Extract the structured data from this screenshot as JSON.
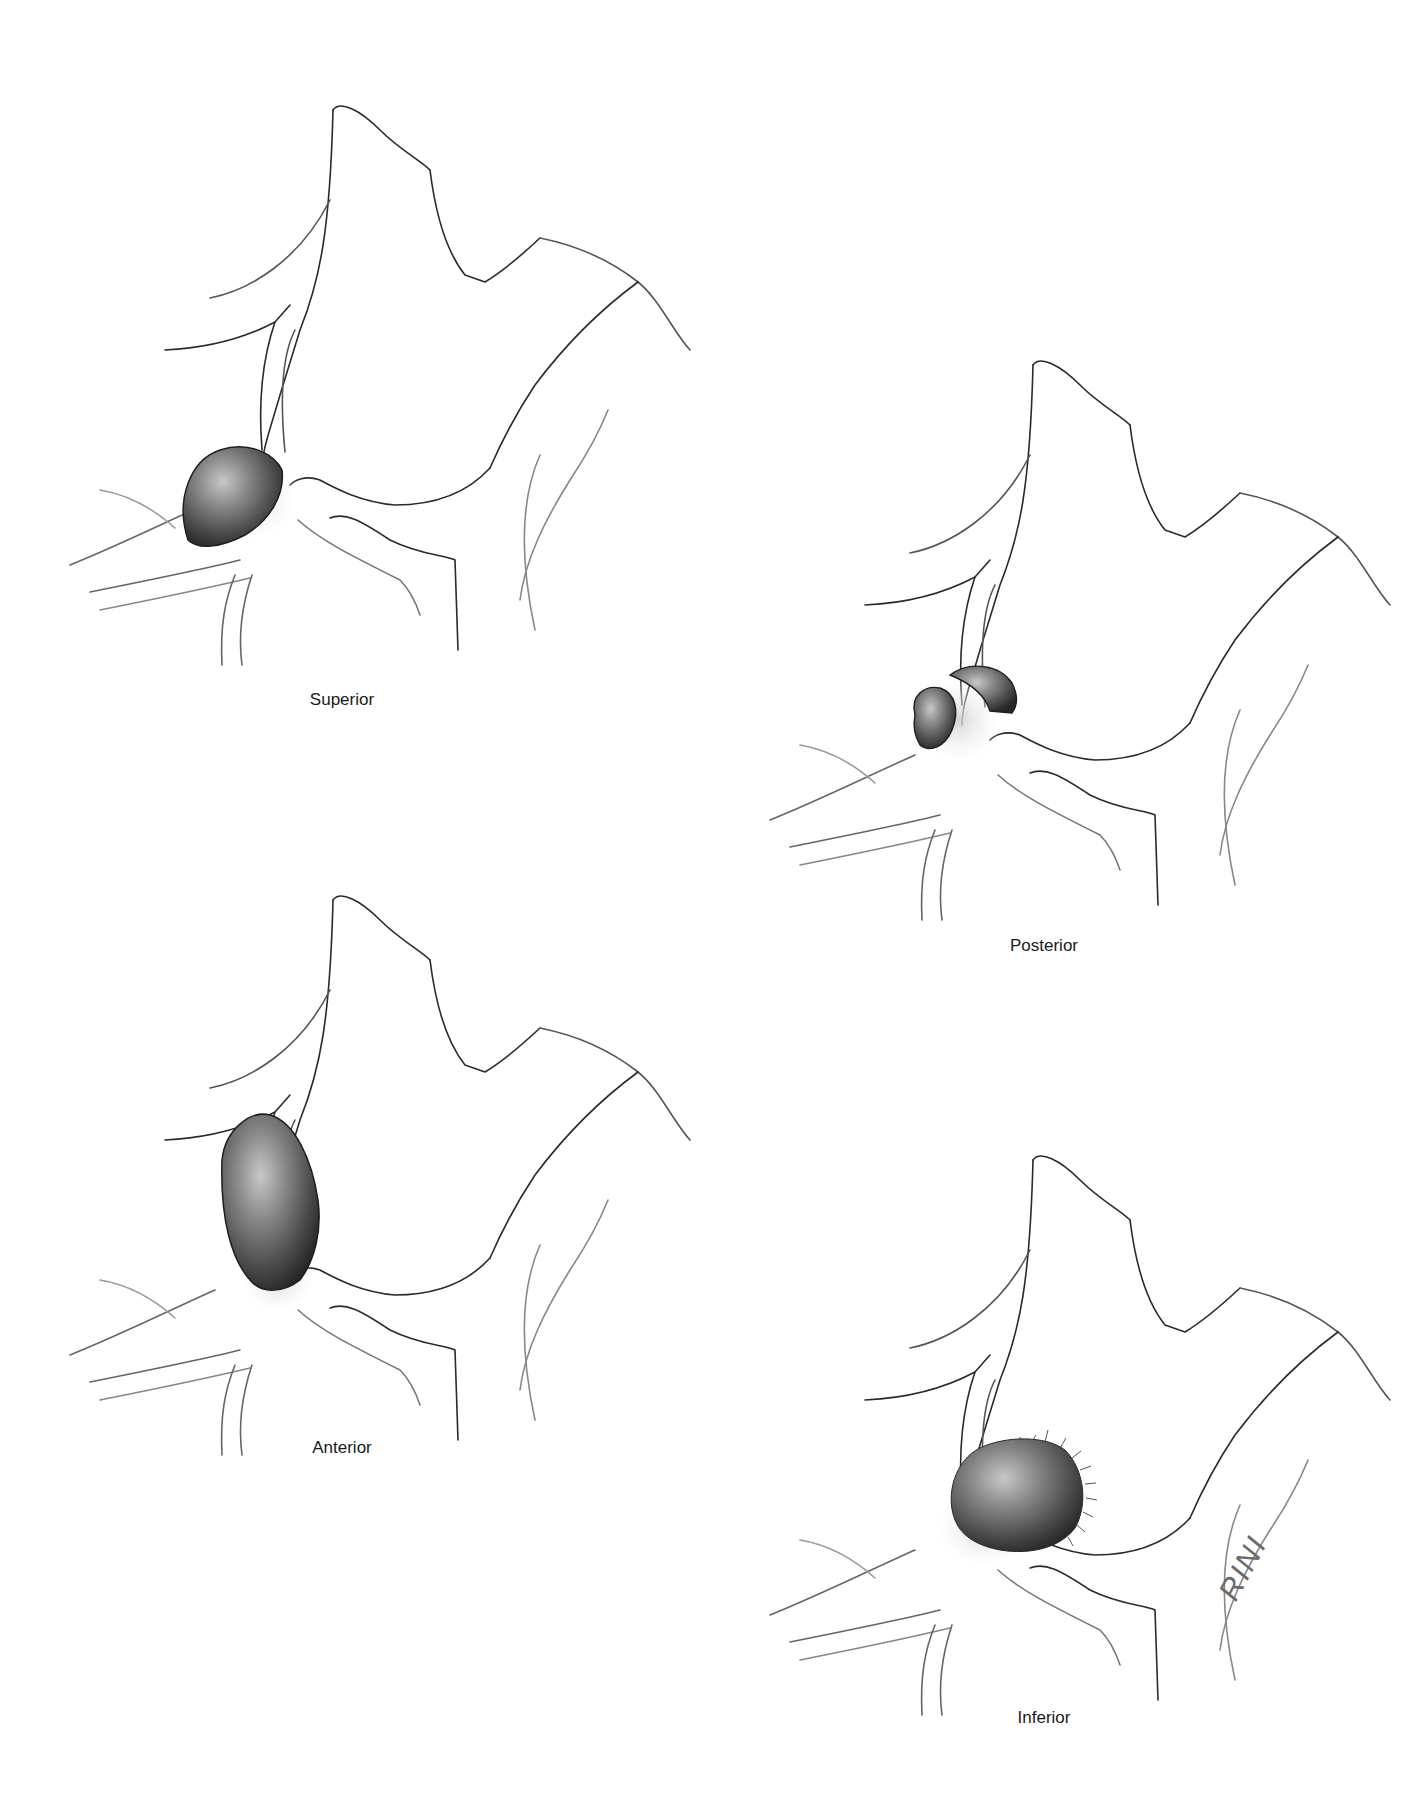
{
  "figure": {
    "panels": [
      {
        "id": "superior",
        "label": "Superior",
        "label_pos": [
          342,
          690
        ]
      },
      {
        "id": "posterior",
        "label": "Posterior",
        "label_pos": [
          1044,
          936
        ]
      },
      {
        "id": "anterior",
        "label": "Anterior",
        "label_pos": [
          342,
          1438
        ]
      },
      {
        "id": "inferior",
        "label": "Inferior",
        "label_pos": [
          1044,
          1708
        ]
      }
    ],
    "signature": "RINI",
    "colors": {
      "line": "#2a2a2a",
      "faint_line": "#9a9a9a",
      "sac_dark": "#2e2e2e",
      "sac_mid": "#6f6f6f",
      "sac_light": "#cfcfcf",
      "neck_glow": "#d9d9d9"
    }
  }
}
